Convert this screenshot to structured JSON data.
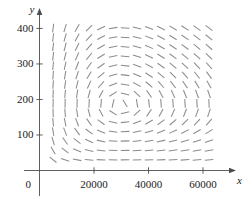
{
  "chart_data": {
    "type": "scatter",
    "plot_kind": "direction-field",
    "title": "",
    "xlabel": "x",
    "ylabel": "y",
    "xlim": [
      0,
      66000
    ],
    "ylim": [
      0,
      430
    ],
    "grid": false,
    "legend": null,
    "axis_color": "#4d4d4d",
    "segment_color": "#8c8c8c",
    "origin_label": "0",
    "x_ticks": [
      {
        "value": 20000,
        "label": "20000"
      },
      {
        "value": 40000,
        "label": "40000"
      },
      {
        "value": 60000,
        "label": "60000"
      }
    ],
    "y_ticks": [
      {
        "value": 100,
        "label": "100"
      },
      {
        "value": 200,
        "label": "200"
      },
      {
        "value": 300,
        "label": "300"
      },
      {
        "value": 400,
        "label": "400"
      }
    ],
    "field": {
      "x_start": 5000,
      "x_step": 4400,
      "x_count": 14,
      "y_start": 30,
      "y_step": 26.5,
      "y_count": 15,
      "center_x": 30000,
      "center_y": 185,
      "segment_length": 8.6,
      "model": "lotka-volterra",
      "dx_coeff": 5.2e-06,
      "dy_coeff": 5.2e-07,
      "x_scale_ref": 30000,
      "y_scale_ref": 185
    }
  }
}
